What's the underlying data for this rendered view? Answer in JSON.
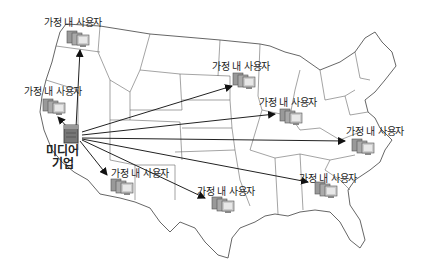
{
  "hub": {
    "label_line1": "미디어",
    "label_line2": "기업",
    "x": 70,
    "y": 135
  },
  "user_label": "가정 내 사용자",
  "nodes": [
    {
      "label": "가정 내 사용자",
      "lx": 44,
      "ly": 14,
      "ix": 66,
      "iy": 29
    },
    {
      "label": "가정 내 사용자",
      "lx": 24,
      "ly": 83,
      "ix": 42,
      "iy": 97
    },
    {
      "label": "가정 내 사용자",
      "lx": 212,
      "ly": 58,
      "ix": 232,
      "iy": 71
    },
    {
      "label": "가정 내 사용자",
      "lx": 259,
      "ly": 94,
      "ix": 279,
      "iy": 107
    },
    {
      "label": "가정 내 사용자",
      "lx": 346,
      "ly": 123,
      "ix": 351,
      "iy": 137
    },
    {
      "label": "가정 내 사용자",
      "lx": 111,
      "ly": 165,
      "ix": 110,
      "iy": 177
    },
    {
      "label": "가정 내 사용자",
      "lx": 197,
      "ly": 183,
      "ix": 211,
      "iy": 195
    },
    {
      "label": "가정 내 사용자",
      "lx": 299,
      "ly": 170,
      "ix": 314,
      "iy": 180
    }
  ],
  "colors": {
    "line": "#222222",
    "border": "#555555",
    "server": "#6a6a6a"
  }
}
